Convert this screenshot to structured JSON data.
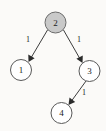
{
  "figure": {
    "type": "directed-graph",
    "background_color": "#fbfaf8",
    "width": 106,
    "height": 131
  },
  "graph_data": {
    "type": "diagram",
    "directed": true,
    "nodes": [
      {
        "id": "n2",
        "label": "2",
        "cx": 55.5,
        "cy": 22.5,
        "r": 10.5,
        "shaded": true,
        "fill": "#c9c9c9",
        "stroke": "#6b6b6b"
      },
      {
        "id": "n1",
        "label": "1",
        "cx": 21.0,
        "cy": 70.0,
        "r": 10.5,
        "shaded": false,
        "fill": "#ffffff",
        "stroke": "#595959"
      },
      {
        "id": "n3",
        "label": "3",
        "cx": 89.5,
        "cy": 71.0,
        "r": 10.5,
        "shaded": false,
        "fill": "#ffffff",
        "stroke": "#595959"
      },
      {
        "id": "n4",
        "label": "4",
        "cx": 61.5,
        "cy": 113.0,
        "r": 10.5,
        "shaded": false,
        "fill": "#ffffff",
        "stroke": "#595959"
      }
    ],
    "edges": [
      {
        "id": "e21",
        "from": "n2",
        "to": "n1",
        "weight": "1",
        "x1": 47.5,
        "y1": 30.0,
        "x2": 28.5,
        "y2": 62.0,
        "label_x": 28.0,
        "label_y": 39.0
      },
      {
        "id": "e23",
        "from": "n2",
        "to": "n3",
        "weight": "1",
        "x1": 63.5,
        "y1": 30.0,
        "x2": 82.5,
        "y2": 63.0,
        "label_x": 79.0,
        "label_y": 39.0
      },
      {
        "id": "e34",
        "from": "n3",
        "to": "n4",
        "weight": "1",
        "x1": 86.0,
        "y1": 81.0,
        "x2": 68.5,
        "y2": 105.0,
        "label_x": 84.0,
        "label_y": 92.0
      }
    ],
    "node_labels": [
      "2",
      "1",
      "3",
      "4"
    ],
    "edge_weights": [
      "1",
      "1",
      "1"
    ],
    "highlighted_node": "2"
  }
}
